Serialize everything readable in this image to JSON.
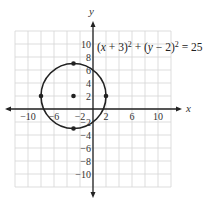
{
  "chart_data": {
    "type": "scatter",
    "title": "",
    "equation": "(x + 3)^2 + (y − 2)^2 = 25",
    "equation_parts": [
      "(",
      "x",
      " + 3)",
      "2",
      " + (",
      "y",
      " − 2)",
      "2",
      " = 25"
    ],
    "xlabel": "x",
    "ylabel": "y",
    "xlim": [
      -12,
      12
    ],
    "ylim": [
      -12,
      12
    ],
    "grid": true,
    "grid_step": 2,
    "x_ticks": [
      -10,
      -6,
      -2,
      2,
      6,
      10
    ],
    "x_tick_labels": [
      "−10",
      "−6",
      "−2",
      "2",
      "6",
      "10"
    ],
    "y_ticks": [
      10,
      8,
      6,
      4,
      2,
      -2,
      -4,
      -6,
      -8,
      -10
    ],
    "y_tick_labels": [
      "10",
      "8",
      "6",
      "4",
      "2",
      "−2",
      "−4",
      "−6",
      "−8",
      "−10"
    ],
    "circle": {
      "center": [
        -3,
        2
      ],
      "radius": 5
    },
    "points": [
      {
        "x": -3,
        "y": 2,
        "label": "center"
      },
      {
        "x": -3,
        "y": 7
      },
      {
        "x": -3,
        "y": -3
      },
      {
        "x": -8,
        "y": 2
      },
      {
        "x": 2,
        "y": 2
      }
    ],
    "colors": {
      "grid": "#d4d4d4",
      "axis": "#222222",
      "curve": "#222222"
    }
  }
}
